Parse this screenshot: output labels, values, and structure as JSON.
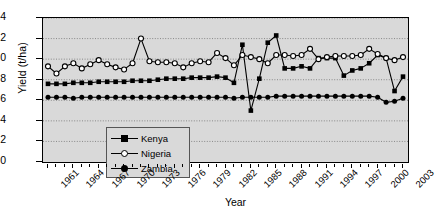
{
  "chart_data": {
    "type": "line",
    "title": "",
    "xlabel": "Year",
    "ylabel": "Yield (t/ha)",
    "xlim": [
      1961,
      2003
    ],
    "ylim": [
      0,
      14
    ],
    "yticks": [
      0,
      2,
      4,
      6,
      8,
      10,
      12,
      14
    ],
    "xticks": [
      1961,
      1964,
      1967,
      1970,
      1973,
      1976,
      1979,
      1982,
      1985,
      1988,
      1991,
      1994,
      1997,
      2000,
      2003
    ],
    "xtick_all": [
      1961,
      1962,
      1963,
      1964,
      1965,
      1966,
      1967,
      1968,
      1969,
      1970,
      1971,
      1972,
      1973,
      1974,
      1975,
      1976,
      1977,
      1978,
      1979,
      1980,
      1981,
      1982,
      1983,
      1984,
      1985,
      1986,
      1987,
      1988,
      1989,
      1990,
      1991,
      1992,
      1993,
      1994,
      1995,
      1996,
      1997,
      1998,
      1999,
      2000,
      2001,
      2002,
      2003
    ],
    "grid": true,
    "grid_style": "dotted",
    "legend_position": "lower-left-inside",
    "plot_background": "#d9d9d9",
    "x": [
      1961,
      1962,
      1963,
      1964,
      1965,
      1966,
      1967,
      1968,
      1969,
      1970,
      1971,
      1972,
      1973,
      1974,
      1975,
      1976,
      1977,
      1978,
      1979,
      1980,
      1981,
      1982,
      1983,
      1984,
      1985,
      1986,
      1987,
      1988,
      1989,
      1990,
      1991,
      1992,
      1993,
      1994,
      1995,
      1996,
      1997,
      1998,
      1999,
      2000,
      2001,
      2002,
      2003
    ],
    "series": [
      {
        "name": "Kenya",
        "marker": "filled-square",
        "color": "#000000",
        "values": [
          7.6,
          7.6,
          7.6,
          7.7,
          7.7,
          7.7,
          7.8,
          7.8,
          7.8,
          7.8,
          7.9,
          7.9,
          7.9,
          8.0,
          8.1,
          8.1,
          8.1,
          8.2,
          8.2,
          8.2,
          8.3,
          8.2,
          7.7,
          11.4,
          5.0,
          8.1,
          11.6,
          12.3,
          9.1,
          9.1,
          9.3,
          9.1,
          10.1,
          10.1,
          10.1,
          8.4,
          8.9,
          9.1,
          9.6,
          10.4,
          10.1,
          6.9,
          8.3
        ]
      },
      {
        "name": "Nigeria",
        "marker": "open-circle",
        "color": "#000000",
        "values": [
          9.3,
          8.6,
          9.3,
          9.6,
          9.1,
          9.5,
          9.9,
          9.5,
          9.2,
          9.0,
          9.6,
          12.0,
          9.8,
          9.7,
          9.7,
          9.6,
          9.2,
          9.6,
          9.8,
          9.7,
          10.6,
          10.1,
          9.4,
          10.4,
          10.2,
          10.0,
          9.6,
          10.4,
          10.4,
          10.3,
          10.4,
          11.0,
          10.0,
          10.2,
          10.3,
          10.3,
          10.3,
          10.4,
          11.0,
          10.5,
          10.1,
          9.9,
          10.2
        ]
      },
      {
        "name": "Zambia",
        "marker": "filled-circle",
        "color": "#000000",
        "values": [
          6.3,
          6.3,
          6.3,
          6.2,
          6.3,
          6.3,
          6.3,
          6.3,
          6.3,
          6.3,
          6.3,
          6.3,
          6.3,
          6.3,
          6.3,
          6.3,
          6.3,
          6.3,
          6.3,
          6.3,
          6.3,
          6.3,
          6.2,
          6.3,
          6.3,
          6.3,
          6.3,
          6.4,
          6.4,
          6.4,
          6.4,
          6.4,
          6.4,
          6.4,
          6.4,
          6.4,
          6.4,
          6.4,
          6.4,
          6.3,
          5.8,
          5.9,
          6.2
        ]
      }
    ]
  },
  "legend": {
    "items": [
      {
        "label": "Kenya"
      },
      {
        "label": "Nigeria"
      },
      {
        "label": "Zambia"
      }
    ]
  },
  "caption": ""
}
